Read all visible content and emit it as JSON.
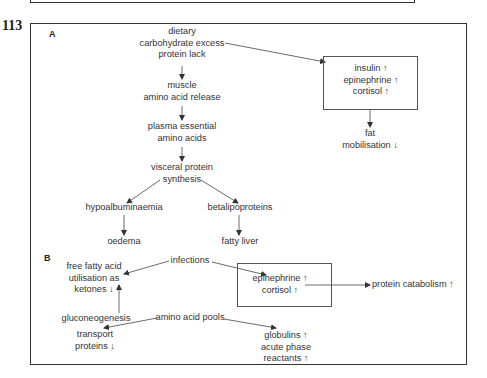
{
  "figure": {
    "number": "113",
    "panels": {
      "A": {
        "label": "A",
        "nodes": {
          "diet": [
            "dietary",
            "carbohydrate excess",
            "protein lack"
          ],
          "muscle": [
            "muscle",
            "amino acid release"
          ],
          "plasma": [
            "plasma essential",
            "amino acids"
          ],
          "visceral": [
            "visceral protein",
            "synthesis"
          ],
          "hypoalb": "hypoalbuminaemia",
          "oedema": "oedema",
          "betalipo": "betalipoproteins",
          "fatty_liver": "fatty liver",
          "hormones": [
            "insulin ↑",
            "epinephrine ↑",
            "cortisol ↑"
          ],
          "fat_mob": [
            "fat",
            "mobilisation ↓"
          ]
        }
      },
      "B": {
        "label": "B",
        "nodes": {
          "infections": "infections",
          "ffa": [
            "free fatty acid",
            "utilisation as",
            "ketones ↓"
          ],
          "hormones": [
            "epinephrine ↑",
            "cortisol ↑"
          ],
          "protein_cat": "protein catabolism ↑",
          "gluconeo": "gluconeogenesis",
          "aa_pools": "amino acid pools",
          "transport": [
            "transport",
            "proteins ↓"
          ],
          "globulins": [
            "globulins ↑",
            "acute phase",
            "reactants ↑"
          ]
        }
      }
    },
    "colors": {
      "line": "#333333",
      "text": "#333333",
      "background": "#ffffff"
    }
  }
}
